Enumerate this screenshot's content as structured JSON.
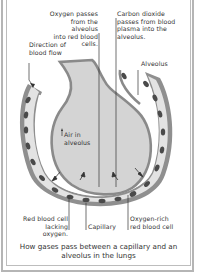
{
  "diagram": {
    "caption": "How gases pass between a capillary and an alveolus in the lungs",
    "labels": {
      "oxygen": "Oxygen passes\nfrom the alveolus\ninto red blood cells.",
      "co2": "Carbon dioxide\npasses from blood\nplasma into the\nalveolus.",
      "direction": "Direction of\nblood flow",
      "alveolus": "Alveolus",
      "air": "Air in\nalveolus",
      "rbc_low": "Red blood cell\nlacking oxygen.",
      "capillary": "Capillary",
      "rbc_rich": "Oxygen-rich\nred blood cell"
    },
    "colors": {
      "alveolus_fill": "#d9d9d9",
      "capillary_wall": "#8a8a8a",
      "plasma": "#e6e6e6",
      "rbc": "#4a4a4a",
      "frame": "#b5b5b5",
      "text": "#333333"
    }
  }
}
